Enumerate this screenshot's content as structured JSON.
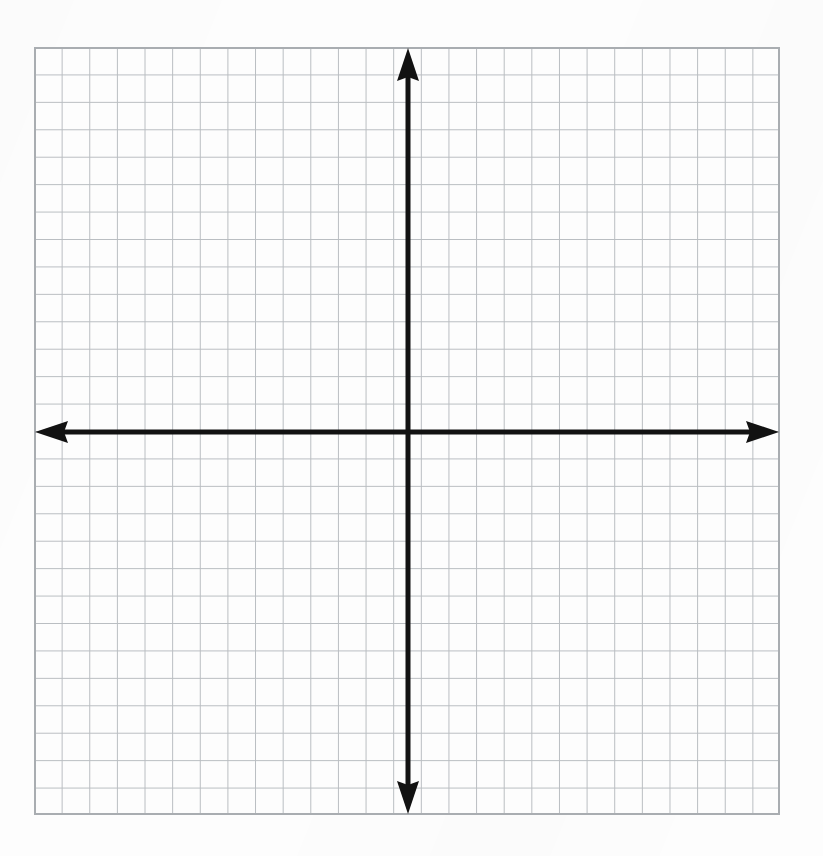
{
  "document": {
    "kind": "blank-cartesian-coordinate-grid-worksheet",
    "background_color": "#fdfdfd"
  },
  "figure": {
    "left": 34,
    "top": 47,
    "width": 746,
    "height": 768
  },
  "chart_data": {
    "type": "scatter",
    "title": "",
    "subtitle": "",
    "xlabel": "",
    "ylabel": "",
    "x": [],
    "y": [],
    "series": [],
    "categories": [],
    "values": [],
    "annotations": [],
    "legend": {
      "entries": [],
      "position": "none",
      "visible": false
    },
    "grid": {
      "visible": true,
      "minor_only": true,
      "columns": 27,
      "rows": 28,
      "cell_size_px": 27.4,
      "line_color": "#b9bdc1",
      "line_width_px": 1,
      "border_color": "#a9adb1",
      "border_width_px": 2,
      "tick_labels_visible": false
    },
    "axes": {
      "x_axis": {
        "label": "",
        "color": "#121212",
        "line_width_px": 5,
        "arrow_start": true,
        "arrow_end": true,
        "tick_labels": [],
        "ticks_visible": false,
        "range_cells": [
          -13.5,
          13.5
        ]
      },
      "y_axis": {
        "label": "",
        "color": "#121212",
        "line_width_px": 5,
        "arrow_start": true,
        "arrow_end": true,
        "tick_labels": [],
        "ticks_visible": false,
        "range_cells": [
          -14,
          14
        ]
      },
      "origin_px": {
        "x": 408,
        "y": 432
      },
      "origin_label": ""
    },
    "xlim": [
      -13.5,
      13.5
    ],
    "ylim": [
      -14,
      14
    ]
  },
  "colors": {
    "page_background": "#fdfdfd",
    "grid_line": "#b9bdc1",
    "grid_border": "#a9adb1",
    "axis": "#121212"
  }
}
